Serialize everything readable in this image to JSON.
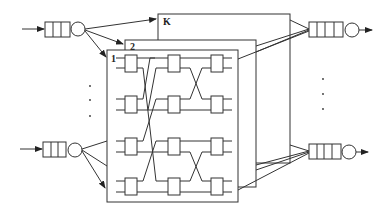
{
  "diagram": {
    "type": "switch-fabric",
    "planes": [
      {
        "label": "K"
      },
      {
        "label": "2"
      },
      {
        "label": "1"
      }
    ],
    "input_ports": [
      {
        "name": "input-queue-top",
        "queue_slots": 3
      },
      {
        "name": "input-queue-bottom",
        "queue_slots": 3
      }
    ],
    "output_ports": [
      {
        "name": "output-queue-top",
        "queue_slots": 4
      },
      {
        "name": "output-queue-bottom",
        "queue_slots": 4
      }
    ],
    "switch_stages": 3,
    "switches_per_stage": 4,
    "ellipsis": "..."
  }
}
